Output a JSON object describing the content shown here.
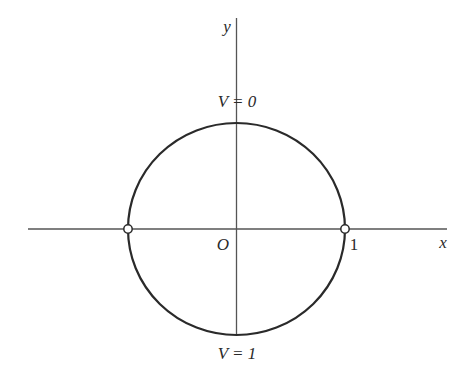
{
  "diagram": {
    "type": "unit-circle-boundary-conditions",
    "colors": {
      "stroke": "#2a2a2a",
      "axis": "#555555",
      "background": "#ffffff",
      "marker_fill": "#ffffff"
    },
    "axes": {
      "x_label": "x",
      "y_label": "y",
      "origin_label": "O",
      "x_tick_label": "1"
    },
    "annotations": {
      "top": "V = 0",
      "bottom": "V = 1"
    },
    "markers": [
      {
        "name": "left-point",
        "position": "(-1, 0)"
      },
      {
        "name": "right-point",
        "position": "(1, 0)"
      }
    ]
  }
}
